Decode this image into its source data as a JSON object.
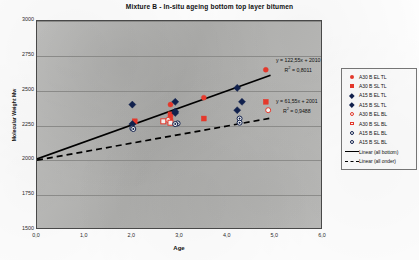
{
  "chart_data": {
    "type": "scatter",
    "title": "Mixture B - In-situ ageing bottom top layer bitumen",
    "xlabel": "Age",
    "ylabel": "Molecular Weight Mw",
    "xlim": [
      0.0,
      6.0
    ],
    "ylim": [
      1500,
      3000
    ],
    "xticks": [
      "0,0",
      "1,0",
      "2,0",
      "3,0",
      "4,0",
      "5,0",
      "6,0"
    ],
    "xtick_values": [
      0.0,
      1.0,
      2.0,
      3.0,
      4.0,
      5.0,
      6.0
    ],
    "yticks": [
      "3000",
      "2750",
      "2500",
      "2250",
      "2000",
      "1750",
      "1500"
    ],
    "ytick_values": [
      3000,
      2750,
      2500,
      2250,
      2000,
      1750,
      1500
    ],
    "grid": "horizontal",
    "legend_position": "right",
    "series": [
      {
        "name": "A30 B EL TL",
        "marker": "circle-filled",
        "color": "#e8392c",
        "points": [
          [
            2.8,
            2400
          ],
          [
            2.8,
            2300
          ],
          [
            3.5,
            2450
          ],
          [
            4.8,
            2650
          ]
        ]
      },
      {
        "name": "A30 B SL TL",
        "marker": "square-filled",
        "color": "#e8392c",
        "points": [
          [
            2.05,
            2280
          ],
          [
            2.8,
            2330
          ],
          [
            3.5,
            2300
          ],
          [
            4.8,
            2420
          ]
        ]
      },
      {
        "name": "A15 B EL TL",
        "marker": "diamond-filled",
        "color": "#11214e",
        "points": [
          [
            2.0,
            2400
          ],
          [
            2.9,
            2420
          ],
          [
            4.2,
            2520
          ],
          [
            4.3,
            2420
          ]
        ]
      },
      {
        "name": "A15 B SL TL",
        "marker": "diamond-filled",
        "color": "#11214e",
        "points": [
          [
            2.0,
            2260
          ],
          [
            2.9,
            2340
          ],
          [
            4.2,
            2360
          ],
          [
            2.9,
            2350
          ]
        ]
      },
      {
        "name": "A30 B EL BL",
        "marker": "circle-open",
        "color": "#e8392c",
        "points": [
          [
            2.75,
            2290
          ],
          [
            4.85,
            2360
          ]
        ]
      },
      {
        "name": "A30 B SL BL",
        "marker": "square-open",
        "color": "#e8392c",
        "points": [
          [
            2.65,
            2280
          ],
          [
            2.8,
            2270
          ]
        ]
      },
      {
        "name": "A15 B EL BL",
        "marker": "circle-open-dot",
        "color": "#11214e",
        "points": [
          [
            2.0,
            2230
          ],
          [
            2.95,
            2265
          ],
          [
            4.25,
            2300
          ]
        ]
      },
      {
        "name": "A15 B SL BL",
        "marker": "circle-open-dot",
        "color": "#11214e",
        "points": [
          [
            2.02,
            2225
          ],
          [
            2.9,
            2260
          ],
          [
            4.25,
            2270
          ]
        ]
      }
    ],
    "trendlines": [
      {
        "name": "Linear (all bottom)",
        "style": "solid",
        "color": "#000000",
        "slope": 122.55,
        "intercept": 2010,
        "equation": "y = 122,55x + 2010",
        "r2_label": "R",
        "r2_exp": "2",
        "r2_value": " = 0,8011"
      },
      {
        "name": "Linear (all onder)",
        "style": "dashed",
        "color": "#000000",
        "slope": 61.55,
        "intercept": 2001,
        "equation": "y = 61,55x + 2001",
        "r2_label": "R",
        "r2_exp": "2",
        "r2_value": " = 0,9488"
      }
    ]
  },
  "legend": {
    "items": [
      {
        "label": "A30 B EL TL"
      },
      {
        "label": "A30 B SL TL"
      },
      {
        "label": "A15 B EL TL"
      },
      {
        "label": "A15 B SL TL"
      },
      {
        "label": "A30 B EL BL"
      },
      {
        "label": "A30 B SL BL"
      },
      {
        "label": "A15 B EL BL"
      },
      {
        "label": "A15 B SL BL"
      },
      {
        "label": "Linear (all bottom)"
      },
      {
        "label": "Linear (all onder)"
      }
    ]
  },
  "annotations": {
    "eq1_line1": "y = 122,55x + 2010",
    "eq1_r2_prefix": "R",
    "eq1_r2_sup": "2",
    "eq1_r2_rest": " = 0,8011",
    "eq2_line1": "y = 61,55x + 2001",
    "eq2_r2_prefix": "R",
    "eq2_r2_sup": "2",
    "eq2_r2_rest": " = 0,9488"
  },
  "colors": {
    "red": "#e8392c",
    "navy": "#11214e",
    "plot_bg": "#b9b9b7",
    "grid": "#8e8e8c",
    "axis": "#4a4a4a"
  }
}
